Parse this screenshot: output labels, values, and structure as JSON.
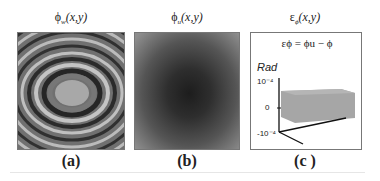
{
  "figure": {
    "panels": [
      {
        "title_sym": "ϕ",
        "title_sub": "w",
        "title_args": "(x,y)",
        "label": "(a)"
      },
      {
        "title_sym": "ϕ",
        "title_sub": "u",
        "title_args": "(x,y)",
        "label": "(b)"
      },
      {
        "title_sym": "ε",
        "title_sub": "ϕ",
        "title_args": "(x,y)",
        "label": "(c )"
      }
    ],
    "panel_c": {
      "equation": "εϕ = ϕu − ϕ",
      "axis_label": "Rad",
      "ticks": [
        "10⁻⁴",
        "0",
        "-10⁻⁴"
      ]
    }
  },
  "colors": {
    "border": "#777777",
    "error_block": "#9a9a9a"
  }
}
